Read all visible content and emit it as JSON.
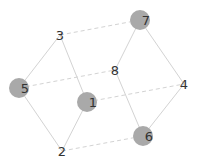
{
  "graph": {
    "node_fill": "#a9a9a9",
    "edge_color": "#d3d3d3",
    "label_color": "#333333",
    "nodes": [
      {
        "id": "1",
        "label": "1",
        "x": 87,
        "y": 102,
        "filled": true
      },
      {
        "id": "2",
        "label": "2",
        "x": 62,
        "y": 151,
        "filled": false
      },
      {
        "id": "3",
        "label": "3",
        "x": 60,
        "y": 35,
        "filled": false
      },
      {
        "id": "4",
        "label": "4",
        "x": 184,
        "y": 84,
        "filled": false
      },
      {
        "id": "5",
        "label": "5",
        "x": 19,
        "y": 88,
        "filled": true
      },
      {
        "id": "6",
        "label": "6",
        "x": 143,
        "y": 136,
        "filled": true
      },
      {
        "id": "7",
        "label": "7",
        "x": 140,
        "y": 20,
        "filled": true
      },
      {
        "id": "8",
        "label": "8",
        "x": 115,
        "y": 70,
        "filled": false
      }
    ],
    "edges": [
      {
        "from": "3",
        "to": "7",
        "style": "dashed"
      },
      {
        "from": "3",
        "to": "5",
        "style": "solid"
      },
      {
        "from": "3",
        "to": "1",
        "style": "solid"
      },
      {
        "from": "7",
        "to": "8",
        "style": "solid"
      },
      {
        "from": "7",
        "to": "4",
        "style": "solid"
      },
      {
        "from": "5",
        "to": "8",
        "style": "dashed"
      },
      {
        "from": "5",
        "to": "2",
        "style": "solid"
      },
      {
        "from": "1",
        "to": "2",
        "style": "solid"
      },
      {
        "from": "1",
        "to": "4",
        "style": "dashed"
      },
      {
        "from": "8",
        "to": "6",
        "style": "solid"
      },
      {
        "from": "4",
        "to": "6",
        "style": "solid"
      },
      {
        "from": "2",
        "to": "6",
        "style": "dashed"
      }
    ]
  }
}
